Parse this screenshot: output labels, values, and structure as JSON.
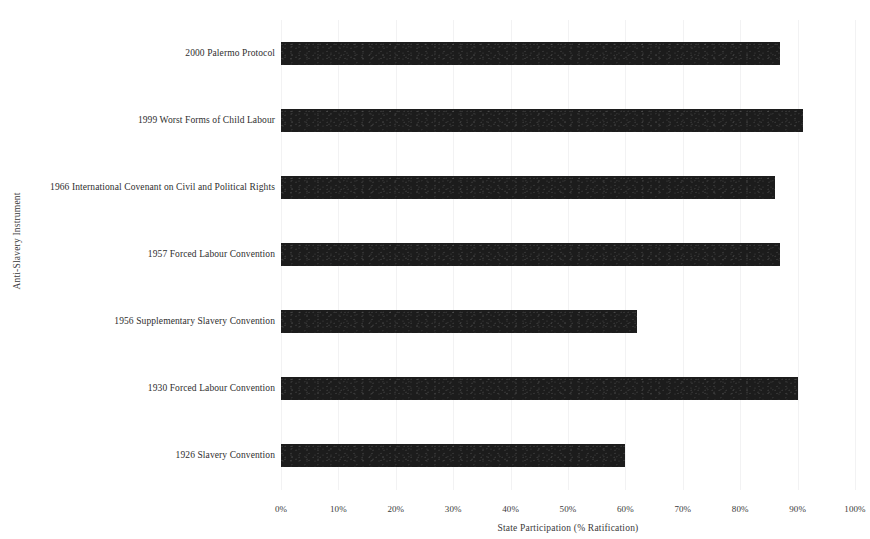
{
  "chart_data": {
    "type": "bar",
    "orientation": "horizontal",
    "title": "",
    "xlabel": "State Participation (% Ratification)",
    "ylabel": "Anti-Slavery Instrument",
    "categories": [
      "2000 Palermo Protocol",
      "1999 Worst Forms of Child Labour",
      "1966 International Covenant on Civil and Political Rights",
      "1957 Forced Labour Convention",
      "1956 Supplementary Slavery Convention",
      "1930 Forced Labour Convention",
      "1926 Slavery Convention"
    ],
    "values": [
      87,
      91,
      86,
      87,
      62,
      90,
      60
    ],
    "xlim": [
      0,
      100
    ],
    "xticks": [
      0,
      10,
      20,
      30,
      40,
      50,
      60,
      70,
      80,
      90,
      100
    ],
    "xtick_labels": [
      "0%",
      "10%",
      "20%",
      "30%",
      "40%",
      "50%",
      "60%",
      "70%",
      "80%",
      "90%",
      "100%"
    ],
    "grid": true,
    "grid_axis": "x",
    "legend": false,
    "bar_color": "#1c1c1c"
  }
}
